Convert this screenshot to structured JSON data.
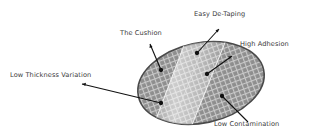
{
  "diagram": {
    "labels": {
      "easy_de_taping": "Easy De-Taping",
      "the_cushion": "The Cushion",
      "high_adhesion": "High Adhesion",
      "low_thickness_variation": "Low Thickness Variation",
      "low_contamination": "Low Contamination"
    },
    "colors": {
      "wafer_fill": "#8a8a8a",
      "wafer_edge": "#4a4a4a",
      "grid_line": "#c8c8c8",
      "tape_highlight": "#dcdcdc",
      "arrow": "#111111",
      "text": "#3a3a3a"
    }
  }
}
